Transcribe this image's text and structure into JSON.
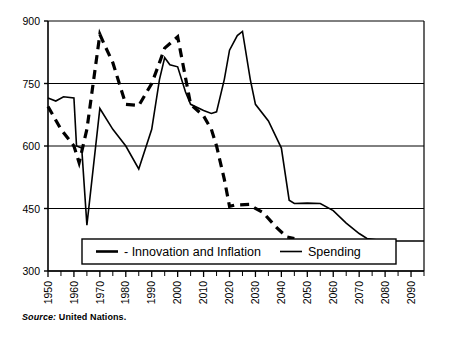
{
  "chart_data": {
    "type": "line",
    "title": "",
    "subtitle": "",
    "xlabel": "",
    "ylabel": "",
    "xlim": [
      1950,
      2095
    ],
    "ylim": [
      300,
      900
    ],
    "yticks": [
      300,
      450,
      600,
      750,
      900
    ],
    "ytick_labels": [
      "300",
      "450",
      "600",
      "750",
      "900"
    ],
    "xticks": [
      1950,
      1960,
      1970,
      1980,
      1990,
      2000,
      2010,
      2020,
      2030,
      2040,
      2050,
      2060,
      2070,
      2080,
      2090
    ],
    "xtick_labels": [
      "1950",
      "1960",
      "1970",
      "1980",
      "1990",
      "2000",
      "2010",
      "2020",
      "2030",
      "2040",
      "2050",
      "2060",
      "2070",
      "2080",
      "2090"
    ],
    "minor_xtick_interval": 5,
    "grid": "horizontal",
    "legend_position": "inside-bottom",
    "series": [
      {
        "name": "- Innovation and Inflation",
        "style": "dashed",
        "color": "#000000",
        "x": [
          1950,
          1955,
          1960,
          1962,
          1965,
          1970,
          1972,
          1975,
          1980,
          1985,
          1990,
          1993,
          1995,
          2000,
          2001,
          2005,
          2010,
          2013,
          2015,
          2018,
          2020,
          2022,
          2028,
          2030,
          2033,
          2038,
          2042,
          2045
        ],
        "values": [
          695,
          640,
          600,
          560,
          640,
          868,
          840,
          800,
          700,
          697,
          750,
          800,
          835,
          862,
          830,
          700,
          672,
          640,
          600,
          520,
          455,
          458,
          460,
          450,
          440,
          405,
          382,
          378
        ]
      },
      {
        "name": "Spending",
        "style": "solid",
        "color": "#000000",
        "x": [
          1950,
          1953,
          1956,
          1960,
          1961,
          1963,
          1965,
          1970,
          1975,
          1980,
          1985,
          1990,
          1993,
          1995,
          1997,
          2000,
          2003,
          2005,
          2010,
          2013,
          2015,
          2018,
          2020,
          2023,
          2025,
          2028,
          2030,
          2035,
          2040,
          2043,
          2045,
          2050,
          2055,
          2060,
          2065,
          2070,
          2073,
          2080,
          2090,
          2095
        ],
        "values": [
          715,
          708,
          718,
          715,
          600,
          595,
          410,
          690,
          640,
          600,
          545,
          640,
          760,
          812,
          795,
          790,
          730,
          700,
          685,
          678,
          682,
          760,
          830,
          865,
          875,
          760,
          700,
          660,
          595,
          470,
          462,
          463,
          462,
          445,
          415,
          390,
          378,
          372,
          372,
          372
        ]
      }
    ]
  },
  "legend": {
    "entries": [
      {
        "label": "- Innovation and Inflation",
        "style": "dashed"
      },
      {
        "label": "Spending",
        "style": "solid"
      }
    ]
  },
  "source": {
    "keyword": "Source:",
    "value": "United Nations."
  },
  "colors": {
    "line": "#000000",
    "grid": "#000000",
    "axis": "#000000",
    "background": "#ffffff"
  }
}
